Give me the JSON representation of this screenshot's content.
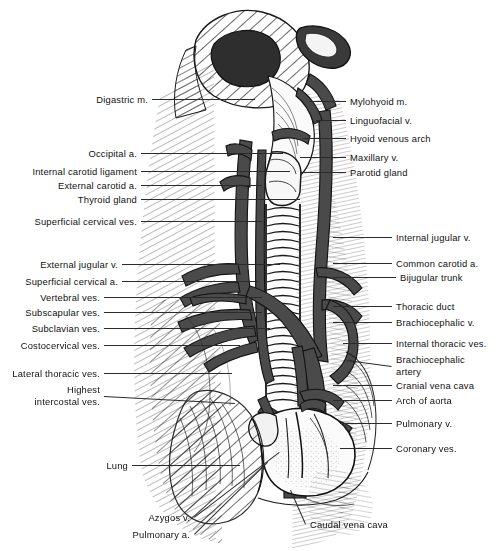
{
  "figure": {
    "width": 503,
    "height": 551,
    "background": "#ffffff",
    "ink_color": "#1a1a1a",
    "vessel_fill": "#4a4a4a",
    "leader_color": "#2b2b2b"
  },
  "labels_left": [
    {
      "id": "digastric-m",
      "text": "Digastric m.",
      "x": 148,
      "y": 99,
      "tip_x": 255,
      "tip_y": 99
    },
    {
      "id": "occipital-a",
      "text": "Occipital a.",
      "x": 137,
      "y": 153,
      "tip_x": 283,
      "tip_y": 153
    },
    {
      "id": "internal-carotid-ligament",
      "text": "Internal carotid ligament",
      "x": 137,
      "y": 171,
      "tip_x": 290,
      "tip_y": 171
    },
    {
      "id": "external-carotid-a",
      "text": "External carotid a.",
      "x": 137,
      "y": 185,
      "tip_x": 262,
      "tip_y": 185
    },
    {
      "id": "thyroid-gland",
      "text": "Thyroid gland",
      "x": 137,
      "y": 199,
      "tip_x": 300,
      "tip_y": 199
    },
    {
      "id": "superficial-cervical-ves",
      "text": "Superficial cervical ves.",
      "x": 137,
      "y": 221,
      "tip_x": 262,
      "tip_y": 221
    },
    {
      "id": "external-jugular-v",
      "text": "External jugular v.",
      "x": 118,
      "y": 264,
      "tip_x": 280,
      "tip_y": 264
    },
    {
      "id": "superficial-cervical-a",
      "text": "Superficial cervical a.",
      "x": 118,
      "y": 281,
      "tip_x": 258,
      "tip_y": 281
    },
    {
      "id": "vertebral-ves",
      "text": "Vertebral ves.",
      "x": 100,
      "y": 297,
      "tip_x": 262,
      "tip_y": 297
    },
    {
      "id": "subscapular-ves",
      "text": "Subscapular ves.",
      "x": 100,
      "y": 312,
      "tip_x": 262,
      "tip_y": 312
    },
    {
      "id": "subclavian-ves",
      "text": "Subclavian ves.",
      "x": 100,
      "y": 328,
      "tip_x": 270,
      "tip_y": 328
    },
    {
      "id": "costocervical-ves",
      "text": "Costocervical ves.",
      "x": 100,
      "y": 345,
      "tip_x": 240,
      "tip_y": 345
    },
    {
      "id": "lateral-thoracic-ves",
      "text": "Lateral thoracic ves.",
      "x": 100,
      "y": 373,
      "tip_x": 232,
      "tip_y": 373
    },
    {
      "id": "highest-intercostal-ves",
      "text": "Highest\nintercostal ves.",
      "x": 100,
      "y": 396,
      "tip_x": 235,
      "tip_y": 403
    },
    {
      "id": "lung",
      "text": "Lung",
      "x": 128,
      "y": 465,
      "tip_x": 240,
      "tip_y": 465
    },
    {
      "id": "azygos-v",
      "text": "Azygos v.",
      "x": 190,
      "y": 517,
      "tip_x": 279,
      "tip_y": 452
    },
    {
      "id": "pulmonary-a",
      "text": "Pulmonary a.",
      "x": 190,
      "y": 534,
      "tip_x": 267,
      "tip_y": 462
    }
  ],
  "labels_right": [
    {
      "id": "mylohyoid-m",
      "text": "Mylohyoid m.",
      "x": 350,
      "y": 101,
      "tip_x": 309,
      "tip_y": 101
    },
    {
      "id": "linguofacial-v",
      "text": "Linguofacial v.",
      "x": 350,
      "y": 120,
      "tip_x": 316,
      "tip_y": 120
    },
    {
      "id": "hyoid-venous-arch",
      "text": "Hyoid venous arch",
      "x": 350,
      "y": 138,
      "tip_x": 302,
      "tip_y": 138
    },
    {
      "id": "maxillary-v",
      "text": "Maxillary v.",
      "x": 350,
      "y": 157,
      "tip_x": 300,
      "tip_y": 157
    },
    {
      "id": "parotid-gland",
      "text": "Parotid gland",
      "x": 350,
      "y": 172,
      "tip_x": 300,
      "tip_y": 172
    },
    {
      "id": "internal-jugular-v",
      "text": "Internal jugular v.",
      "x": 396,
      "y": 237,
      "tip_x": 333,
      "tip_y": 237
    },
    {
      "id": "common-carotid-a",
      "text": "Common carotid a.",
      "x": 396,
      "y": 263,
      "tip_x": 333,
      "tip_y": 263
    },
    {
      "id": "bijugular-trunk",
      "text": "Bijugular trunk",
      "x": 400,
      "y": 277,
      "tip_x": 333,
      "tip_y": 277
    },
    {
      "id": "thoracic-duct",
      "text": "Thoracic duct",
      "x": 396,
      "y": 306,
      "tip_x": 333,
      "tip_y": 306
    },
    {
      "id": "brachiocephalic-v",
      "text": "Brachiocephalic v.",
      "x": 396,
      "y": 322,
      "tip_x": 333,
      "tip_y": 322
    },
    {
      "id": "internal-thoracic-ves",
      "text": "Internal thoracic ves.",
      "x": 396,
      "y": 343,
      "tip_x": 343,
      "tip_y": 343
    },
    {
      "id": "brachiocephalic-artery",
      "text": "Brachiocephalic\nartery",
      "x": 396,
      "y": 366,
      "tip_x": 347,
      "tip_y": 360
    },
    {
      "id": "cranial-vena-cava",
      "text": "Cranial vena cava",
      "x": 396,
      "y": 385,
      "tip_x": 333,
      "tip_y": 385
    },
    {
      "id": "arch-of-aorta",
      "text": "Arch of aorta",
      "x": 396,
      "y": 400,
      "tip_x": 333,
      "tip_y": 400
    },
    {
      "id": "pulmonary-v",
      "text": "Pulmonary v.",
      "x": 396,
      "y": 423,
      "tip_x": 340,
      "tip_y": 423
    },
    {
      "id": "coronary-ves",
      "text": "Coronary ves.",
      "x": 396,
      "y": 448,
      "tip_x": 340,
      "tip_y": 448
    },
    {
      "id": "caudal-vena-cava",
      "text": "Caudal vena cava",
      "x": 310,
      "y": 524,
      "tip_x": 291,
      "tip_y": 490
    }
  ],
  "structures": [
    "trachea",
    "larynx",
    "heart",
    "lung",
    "sternum",
    "ribs",
    "external-jugular-vein",
    "common-carotid-artery",
    "brachiocephalic-vein",
    "cranial-vena-cava",
    "aortic-arch",
    "pulmonary-vessels",
    "azygos-vein"
  ]
}
